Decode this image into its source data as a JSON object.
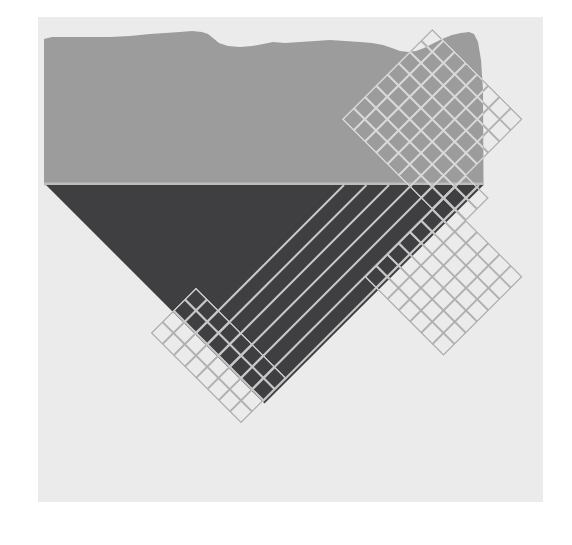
{
  "page": {
    "background_color": "#ffffff",
    "width": 572,
    "height": 545
  },
  "artwork": {
    "description": "Abstract geometric collage: light canvas sheet, gray band with wavy top edge, dark inverted triangle, diagonal stripes, and three rotated wire-mesh grid fragments",
    "canvas": {
      "x": 38,
      "y": 17,
      "width": 505,
      "height": 485,
      "color": "#ebebeb"
    },
    "band": {
      "color": "#9c9c9c",
      "bottom_edge_color": "#bdbdbd",
      "points": [
        [
          44,
          39
        ],
        [
          52,
          37
        ],
        [
          70,
          37
        ],
        [
          90,
          37
        ],
        [
          110,
          37
        ],
        [
          130,
          36
        ],
        [
          150,
          34
        ],
        [
          165,
          33
        ],
        [
          180,
          32
        ],
        [
          192,
          31
        ],
        [
          202,
          32
        ],
        [
          208,
          34
        ],
        [
          213,
          38
        ],
        [
          219,
          43
        ],
        [
          228,
          46
        ],
        [
          240,
          47
        ],
        [
          252,
          46
        ],
        [
          263,
          44
        ],
        [
          273,
          42
        ],
        [
          285,
          43
        ],
        [
          300,
          42
        ],
        [
          315,
          41
        ],
        [
          330,
          40
        ],
        [
          345,
          41
        ],
        [
          360,
          42
        ],
        [
          372,
          43
        ],
        [
          383,
          45
        ],
        [
          392,
          48
        ],
        [
          400,
          51
        ],
        [
          408,
          52
        ],
        [
          416,
          51
        ],
        [
          424,
          48
        ],
        [
          432,
          44
        ],
        [
          442,
          39
        ],
        [
          452,
          35
        ],
        [
          461,
          33
        ],
        [
          469,
          32
        ],
        [
          474,
          34
        ],
        [
          478,
          42
        ],
        [
          481,
          60
        ],
        [
          483,
          90
        ],
        [
          483.5,
          185
        ],
        [
          44,
          185
        ]
      ]
    },
    "triangle": {
      "color": "#3f3f41",
      "points": [
        [
          46,
          185
        ],
        [
          483.5,
          185
        ],
        [
          264.5,
          403.5
        ]
      ]
    },
    "lattice": {
      "pitch": 22.5,
      "stroke_width": 1.8,
      "color_on_light": "#b0b0b0",
      "color_on_band": "#dadada",
      "color_on_dark": "#c8c8c8",
      "regions": [
        {
          "name": "grid-top-right",
          "c": [
            461.5,
            641.5
          ],
          "d": [
            -403,
            -223
          ]
        },
        {
          "name": "grid-right-connector",
          "c": [
            641.5,
            686.5
          ],
          "d": [
            -290.5,
            -245.5
          ]
        },
        {
          "name": "grid-mid-right",
          "c": [
            641.5,
            799
          ],
          "d": [
            -245.5,
            -88
          ]
        },
        {
          "name": "grid-bottom-left-strip",
          "c": [
            484,
            664
          ],
          "d": [
            92,
            182
          ]
        }
      ]
    },
    "stripes": {
      "color": "#c8c8c8",
      "stroke_width": 2,
      "c_start": 529,
      "step": 22.5,
      "count": 7,
      "d_end": 139
    }
  }
}
